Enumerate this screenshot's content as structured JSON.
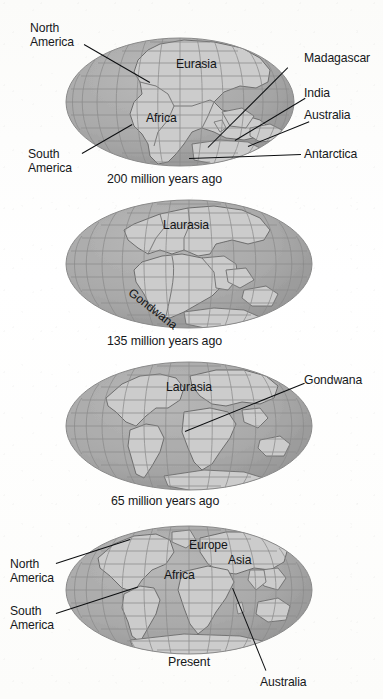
{
  "figure": {
    "background_color": "#fdfdfc",
    "ocean_color": "#a9a9a9",
    "land_color": "#cccccc",
    "grid_color": "#8f8f8f",
    "coast_color": "#6e6e6e",
    "text_color": "#16181a",
    "leader_color": "#0b0d0f"
  },
  "panels": [
    {
      "id": "panel-200ma",
      "caption": "200 million years ago",
      "map_labels": [
        {
          "text": "Eurasia",
          "x": 176,
          "y": 63
        },
        {
          "text": "Africa",
          "x": 151,
          "y": 117
        }
      ],
      "callouts": [
        {
          "text": "North\nAmerica",
          "x": 30,
          "y": 26,
          "align": "left"
        },
        {
          "text": "South\nAmerica",
          "x": 28,
          "y": 150,
          "align": "left"
        },
        {
          "text": "Madagascar",
          "x": 304,
          "y": 53,
          "align": "left"
        },
        {
          "text": "India",
          "x": 304,
          "y": 88,
          "align": "left"
        },
        {
          "text": "Australia",
          "x": 304,
          "y": 110,
          "align": "left"
        },
        {
          "text": "Antarctica",
          "x": 304,
          "y": 149,
          "align": "left"
        }
      ]
    },
    {
      "id": "panel-135ma",
      "caption": "135 million years ago",
      "map_labels": [
        {
          "text": "Laurasia",
          "x": 163,
          "y": 224
        },
        {
          "text": "Gondwana",
          "x": 133,
          "y": 288,
          "rotated": true
        }
      ],
      "callouts": []
    },
    {
      "id": "panel-65ma",
      "caption": "65 million years ago",
      "map_labels": [
        {
          "text": "Laurasia",
          "x": 163,
          "y": 386
        }
      ],
      "callouts": [
        {
          "text": "Gondwana",
          "x": 304,
          "y": 375,
          "align": "left"
        }
      ]
    },
    {
      "id": "panel-present",
      "caption": "Present",
      "map_labels": [
        {
          "text": "Europe",
          "x": 190,
          "y": 539
        },
        {
          "text": "Asia",
          "x": 230,
          "y": 556
        },
        {
          "text": "Africa",
          "x": 168,
          "y": 570
        }
      ],
      "callouts": [
        {
          "text": "North\nAmerica",
          "x": 12,
          "y": 561,
          "align": "left"
        },
        {
          "text": "South\nAmerica",
          "x": 12,
          "y": 607,
          "align": "left"
        },
        {
          "text": "Australia",
          "x": 262,
          "y": 678,
          "align": "left"
        }
      ]
    }
  ],
  "captions": {
    "p1": "200 million years ago",
    "p2": "135 million years ago",
    "p3": "65 million years ago",
    "p4": "Present"
  },
  "labels": {
    "north_america": "North\nAmerica",
    "south_america": "South\nAmerica",
    "madagascar": "Madagascar",
    "india": "India",
    "australia": "Australia",
    "antarctica": "Antarctica",
    "eurasia": "Eurasia",
    "africa": "Africa",
    "laurasia": "Laurasia",
    "gondwana": "Gondwana",
    "europe": "Europe",
    "asia": "Asia"
  }
}
